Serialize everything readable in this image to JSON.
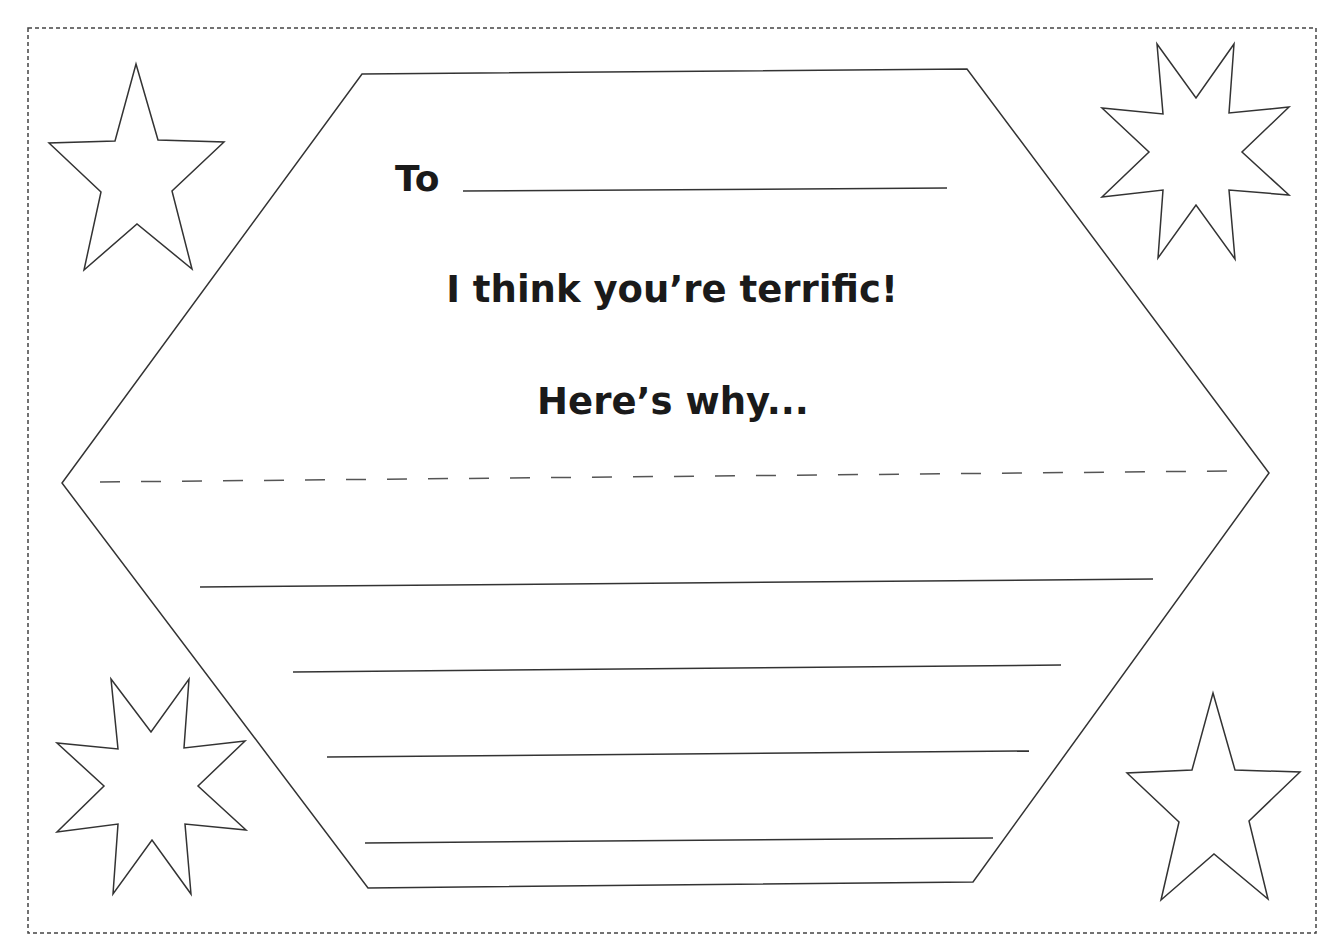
{
  "card": {
    "to_label": "To",
    "headline": "I think you’re terrific!",
    "subline": "Here’s why...",
    "to_field_value": "",
    "reason_lines": [
      "",
      "",
      "",
      ""
    ]
  },
  "decorations": {
    "stars": [
      {
        "position": "top-left",
        "shape": "five-point-star"
      },
      {
        "position": "top-right",
        "shape": "eight-point-star"
      },
      {
        "position": "bottom-left",
        "shape": "eight-point-star"
      },
      {
        "position": "bottom-right",
        "shape": "five-point-star"
      }
    ]
  },
  "colors": {
    "ink": "#1a1a1a",
    "line": "#3a3a3a",
    "background": "#ffffff"
  }
}
